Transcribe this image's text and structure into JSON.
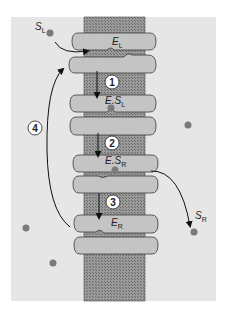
{
  "diagram": {
    "type": "transporter-alternating-access-cycle",
    "colors": {
      "background_panel": "#e6e6e6",
      "membrane_fill": "#8c8c8c",
      "domain_fill": "#c4c4c4",
      "domain_stroke": "#3a3a3a",
      "substrate_dot": "#7a7a7a",
      "arrow": "#111111",
      "step_circle_fill": "#ffffff"
    },
    "labels": {
      "s_left": {
        "main": "S",
        "sub": "L"
      },
      "s_right": {
        "main": "S",
        "sub": "R"
      },
      "e_left": {
        "main": "E",
        "sub": "L"
      },
      "e_s_left": {
        "main": "E.S",
        "sub": "L"
      },
      "e_s_right": {
        "main": "E.S",
        "sub": "R"
      },
      "e_right": {
        "main": "E",
        "sub": "R"
      }
    },
    "steps": [
      {
        "id": "1",
        "label": "1"
      },
      {
        "id": "2",
        "label": "2"
      },
      {
        "id": "3",
        "label": "3"
      },
      {
        "id": "4",
        "label": "4"
      }
    ]
  }
}
